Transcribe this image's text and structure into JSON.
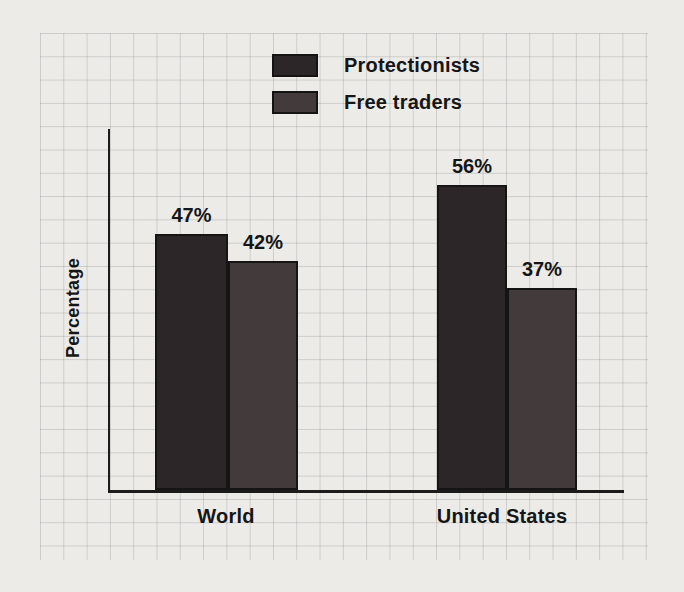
{
  "chart_data": {
    "type": "bar",
    "categories": [
      "World",
      "United States"
    ],
    "series": [
      {
        "name": "Protectionists",
        "color": "#2d2628",
        "values": [
          47,
          56
        ]
      },
      {
        "name": "Free traders",
        "color": "#433a3c",
        "values": [
          42,
          37
        ]
      }
    ],
    "bars": [
      {
        "category": "World",
        "series": "Protectionists",
        "value": 47,
        "label": "47%"
      },
      {
        "category": "World",
        "series": "Free traders",
        "value": 42,
        "label": "42%"
      },
      {
        "category": "United States",
        "series": "Protectionists",
        "value": 56,
        "label": "56%"
      },
      {
        "category": "United States",
        "series": "Free traders",
        "value": 37,
        "label": "37%"
      }
    ],
    "ylabel": "Percentage",
    "ylim": [
      0,
      66
    ],
    "y_axis_ticks": "none",
    "grid": "graph-paper",
    "legend_position": "top-center"
  }
}
